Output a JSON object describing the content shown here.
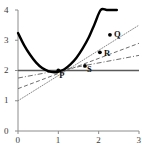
{
  "chart_data": {
    "type": "line",
    "title": "",
    "subtitle": "",
    "xlabel": "",
    "ylabel": "",
    "xlim": [
      0,
      3
    ],
    "ylim": [
      0,
      4
    ],
    "x_ticks": [
      0,
      1,
      2,
      3
    ],
    "y_ticks": [
      0,
      1,
      2,
      3,
      4
    ],
    "x_tick_labels": [
      "0",
      "1",
      "2",
      "3"
    ],
    "y_tick_labels": [
      "0",
      "1",
      "2",
      "3",
      "4"
    ],
    "grid": false,
    "legend": "none",
    "axis_color": "#8c8c8c",
    "curve_color": "#000000",
    "series": [
      {
        "name": "curve",
        "style": "solid-thick",
        "color": "#000000",
        "comment": "parabola y = 1.6(x-0.9)^2 + 1.94 drawn from x=0 to x=2.45",
        "x": [
          0.0,
          0.15,
          0.3,
          0.45,
          0.6,
          0.75,
          0.9,
          1.0,
          1.15,
          1.3,
          1.45,
          1.6,
          1.75,
          1.9,
          2.05,
          2.2,
          2.35,
          2.45
        ],
        "values": [
          3.24,
          2.84,
          2.52,
          2.26,
          2.08,
          1.98,
          1.94,
          1.96,
          2.04,
          2.2,
          2.42,
          2.72,
          3.08,
          3.54,
          4.0,
          4.0,
          4.0,
          4.0
        ]
      },
      {
        "name": "horizontal-line-through-P",
        "style": "solid",
        "color": "#5a5a5a",
        "x": [
          0,
          3
        ],
        "values": [
          2.0,
          2.0
        ]
      },
      {
        "name": "secant-PS",
        "style": "dash-dot",
        "color": "#6e6e6e",
        "x": [
          0,
          3
        ],
        "values": [
          1.75,
          2.5
        ]
      },
      {
        "name": "secant-PR",
        "style": "dashed",
        "color": "#6e6e6e",
        "x": [
          0,
          3
        ],
        "values": [
          1.4,
          2.9
        ]
      },
      {
        "name": "secant-PQ",
        "style": "dotted",
        "color": "#8a8a8a",
        "x": [
          0,
          3
        ],
        "values": [
          1.0,
          3.5
        ]
      }
    ],
    "points": [
      {
        "label": "P",
        "x": 1.0,
        "y": 2.0,
        "label_dx": 1,
        "label_dy": 9
      },
      {
        "label": "S",
        "x": 1.66,
        "y": 2.15,
        "label_dx": 2,
        "label_dy": 8
      },
      {
        "label": "R",
        "x": 2.03,
        "y": 2.6,
        "label_dx": 4,
        "label_dy": 6
      },
      {
        "label": "Q",
        "x": 2.28,
        "y": 3.18,
        "label_dx": 4,
        "label_dy": 4
      }
    ],
    "annotations": []
  }
}
